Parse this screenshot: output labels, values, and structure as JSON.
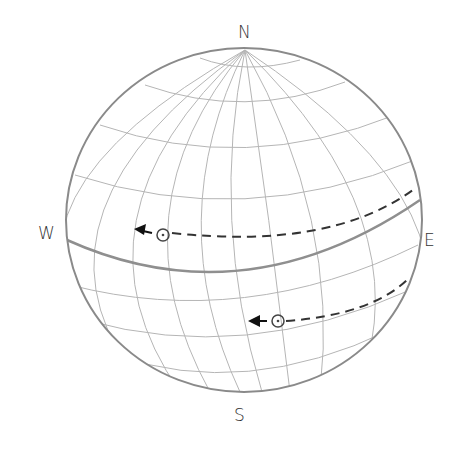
{
  "diagram": {
    "type": "celestial-sphere",
    "labels": {
      "north": "N",
      "south": "S",
      "west": "W",
      "east": "E"
    },
    "sun_paths": [
      {
        "name": "upper-sun-path",
        "direction": "east-to-west",
        "sun_symbol": "⊙"
      },
      {
        "name": "lower-sun-path",
        "direction": "east-to-west",
        "sun_symbol": "⊙"
      }
    ],
    "colors": {
      "grid": "#aaaaaa",
      "outline": "#888888",
      "equator": "#888888",
      "path": "#333333",
      "arrow": "#111111",
      "text": "#333333"
    }
  }
}
